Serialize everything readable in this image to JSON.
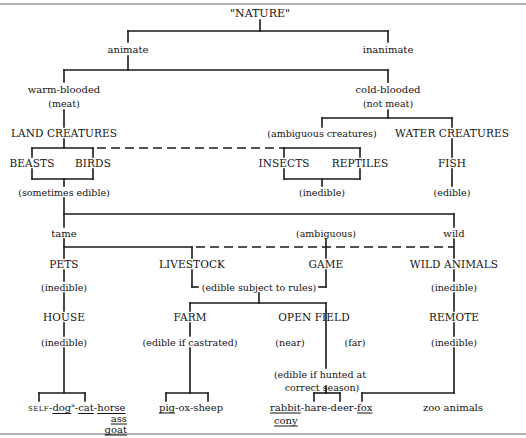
{
  "diagram": {
    "root": "\"NATURE\"",
    "level1": {
      "animate": "animate",
      "inanimate": "inanimate"
    },
    "level2": {
      "warm_blooded": "warm-blooded",
      "warm_note": "(meat)",
      "cold_blooded": "cold-blooded",
      "cold_note": "(not meat)"
    },
    "level3": {
      "land": "LAND CREATURES",
      "ambiguous_creatures": "(ambiguous creatures)",
      "water": "WATER CREATURES"
    },
    "level4": {
      "beasts": "BEASTS",
      "birds": "BIRDS",
      "insects": "INSECTS",
      "reptiles": "REPTILES",
      "fish": "FISH"
    },
    "level4_notes": {
      "land_note": "(sometimes edible)",
      "insect_note": "(inedible)",
      "fish_note": "(edible)"
    },
    "level5": {
      "tame": "tame",
      "ambiguous": "(ambiguous)",
      "wild": "wild"
    },
    "level6": {
      "pets": "PETS",
      "livestock": "LIVESTOCK",
      "game": "GAME",
      "wild_animals": "WILD ANIMALS"
    },
    "level6_notes": {
      "pets_note": "(inedible)",
      "rules_note": "(edible subject to rules)",
      "wild_note": "(inedible)"
    },
    "level7": {
      "house": "HOUSE",
      "farm": "FARM",
      "open_field": "OPEN FIELD",
      "remote": "REMOTE"
    },
    "level7_notes": {
      "house_note": "(inedible)",
      "farm_note": "(edible if castrated)",
      "near": "(near)",
      "far": "(far)",
      "remote_note": "(inedible)",
      "hunted_line1": "(edible if hunted at",
      "hunted_line2": "correct season)"
    },
    "leaves": {
      "house_group": {
        "self": "SELF",
        "sep1": "-",
        "dog": "dog",
        "dog_sup": "a",
        "sep2": "-",
        "cat": "cat",
        "sep3": "-",
        "horse": "horse",
        "ass": "ass",
        "goat": "goat"
      },
      "farm_group": {
        "pig": "pig",
        "rest": "-ox-sheep"
      },
      "field_group": {
        "rabbit": "rabbit",
        "middle": "-hare-deer-",
        "fox": "fox",
        "cony": "cony"
      },
      "remote_group": {
        "zoo": "zoo animals"
      }
    },
    "colors": {
      "ink": "#141414",
      "background": "#ffffff",
      "border": "#555555"
    }
  }
}
